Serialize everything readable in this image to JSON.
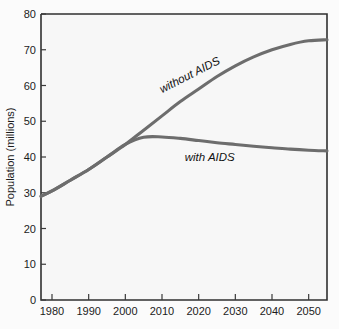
{
  "chart_data": {
    "type": "line",
    "title": "",
    "xlabel": "",
    "ylabel": "Population (millions)",
    "xlim": [
      1977,
      2055
    ],
    "ylim": [
      0,
      80
    ],
    "grid": false,
    "legend_position": "inline-labels",
    "xticks": [
      "1980",
      "1990",
      "2000",
      "2010",
      "2020",
      "2030",
      "2040",
      "2050"
    ],
    "xtick_values": [
      1980,
      1990,
      2000,
      2010,
      2020,
      2030,
      2040,
      2050
    ],
    "yticks": [
      "0",
      "10",
      "20",
      "30",
      "40",
      "50",
      "60",
      "70",
      "80"
    ],
    "ytick_values": [
      0,
      10,
      20,
      30,
      40,
      50,
      60,
      70,
      80
    ],
    "x": [
      1977,
      1980,
      1985,
      1990,
      1995,
      2000,
      2005,
      2010,
      2015,
      2020,
      2025,
      2030,
      2035,
      2040,
      2045,
      2050,
      2055
    ],
    "series": [
      {
        "name": "without AIDS",
        "label": "without AIDS",
        "color": "#6d6d6d",
        "values": [
          29,
          30.5,
          33.5,
          36.5,
          40,
          43.5,
          47.5,
          51.5,
          55.5,
          59,
          62.5,
          65.5,
          68,
          70,
          71.5,
          72.5,
          72.8
        ]
      },
      {
        "name": "with AIDS",
        "label": "with AIDS",
        "color": "#6d6d6d",
        "values": [
          29,
          30.5,
          33.5,
          36.5,
          40,
          43.5,
          45.5,
          45.6,
          45.2,
          44.6,
          44.0,
          43.5,
          43.0,
          42.6,
          42.2,
          41.9,
          41.7
        ]
      }
    ],
    "annotations": [
      {
        "text": "without AIDS",
        "x": 2018,
        "y": 62,
        "rotation": -27
      },
      {
        "text": "with AIDS",
        "x": 2023,
        "y": 39,
        "rotation": 0
      }
    ]
  },
  "axis": {
    "y_title": "Population (millions)"
  }
}
